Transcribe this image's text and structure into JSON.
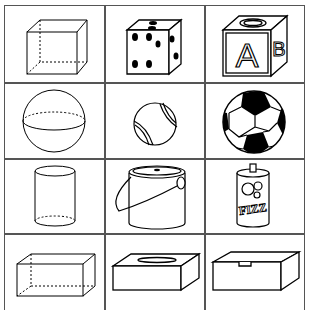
{
  "columns": [
    "shape",
    "object_1",
    "object_2"
  ],
  "rows": [
    {
      "shape": "cube",
      "items": [
        {
          "name": "cube",
          "style": "wireframe"
        },
        {
          "name": "die",
          "style": "object"
        },
        {
          "name": "alphabet-block",
          "style": "object",
          "letters": [
            "A",
            "B"
          ]
        }
      ]
    },
    {
      "shape": "sphere",
      "items": [
        {
          "name": "sphere",
          "style": "wireframe"
        },
        {
          "name": "tennis-ball",
          "style": "object"
        },
        {
          "name": "soccer-ball",
          "style": "object"
        }
      ]
    },
    {
      "shape": "cylinder",
      "items": [
        {
          "name": "cylinder",
          "style": "wireframe"
        },
        {
          "name": "paint-can",
          "style": "object"
        },
        {
          "name": "soda-can",
          "style": "object",
          "label": "FIZZ"
        }
      ]
    },
    {
      "shape": "rectangular-prism",
      "items": [
        {
          "name": "rectangular-prism",
          "style": "wireframe"
        },
        {
          "name": "tissue-box",
          "style": "object"
        },
        {
          "name": "shoe-box",
          "style": "object"
        }
      ]
    }
  ],
  "colors": {
    "line": "#000000",
    "grid": "#555555",
    "background": "#ffffff"
  }
}
